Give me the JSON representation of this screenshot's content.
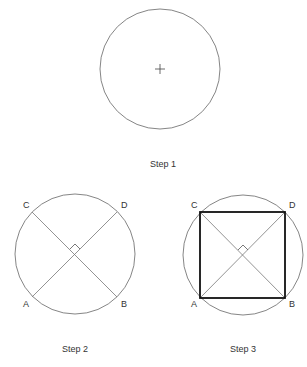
{
  "steps": [
    {
      "caption": "Step 1"
    },
    {
      "caption": "Step 2",
      "points": {
        "A": "A",
        "B": "B",
        "C": "C",
        "D": "D"
      }
    },
    {
      "caption": "Step 3",
      "points": {
        "A": "A",
        "B": "B",
        "C": "C",
        "D": "D"
      }
    }
  ],
  "colors": {
    "stroke": "#555555",
    "square": "#111111",
    "text": "#333333"
  }
}
